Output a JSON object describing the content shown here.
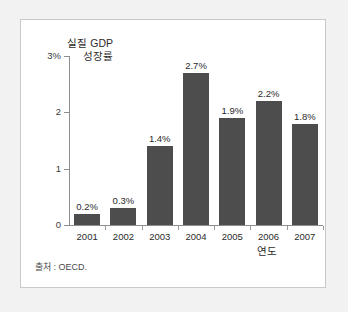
{
  "figure": {
    "background_color": "#f2f2f2",
    "panel_color": "#ffffff",
    "border_color": "#c9c9c9",
    "bar_color": "#4d4d4d",
    "axis_color": "#8e8e8e",
    "source_note": "출처 : OECD."
  },
  "chart_data": {
    "type": "bar",
    "title": "",
    "ylabel": "실질 GDP\n성장률",
    "xlabel": "연도",
    "categories": [
      "2001",
      "2002",
      "2003",
      "2004",
      "2005",
      "2006",
      "2007"
    ],
    "values": [
      0.2,
      0.3,
      1.4,
      2.7,
      1.9,
      2.2,
      1.8
    ],
    "data_labels": [
      "0.2%",
      "0.3%",
      "1.4%",
      "2.7%",
      "1.9%",
      "2.2%",
      "1.8%"
    ],
    "ylim": [
      0,
      3
    ],
    "ytick_values": [
      0,
      1,
      2,
      3
    ],
    "ytick_labels": [
      "0",
      "1",
      "2",
      "3%"
    ],
    "grid": false,
    "legend": null,
    "series": [
      {
        "name": "실질 GDP 성장률",
        "values": [
          0.2,
          0.3,
          1.4,
          2.7,
          1.9,
          2.2,
          1.8
        ]
      }
    ]
  }
}
